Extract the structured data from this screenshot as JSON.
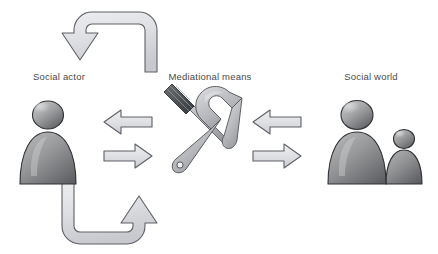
{
  "figure": {
    "background_color": "#ffffff",
    "width": 438,
    "height": 254
  },
  "palette": {
    "arrow_fill_light": "#e8e9ec",
    "arrow_fill_mid": "#d2d4d9",
    "arrow_stroke": "#5d6066",
    "figure_light": "#b9babc",
    "figure_mid": "#8f9193",
    "figure_dark": "#5f6164",
    "tool_light": "#c9cbcd",
    "tool_dark": "#4c4e51",
    "label_color": "#4a4a4a"
  },
  "nodes": [
    {
      "id": "social-actor",
      "label": "Social actor",
      "icon": "single-person-figure-icon",
      "position": "left"
    },
    {
      "id": "mediational-means",
      "label": "Mediational means",
      "icon": "crossed-wrench-screwdriver-icon",
      "position": "center"
    },
    {
      "id": "social-world",
      "label": "Social world",
      "icon": "two-person-figures-icon",
      "position": "right"
    }
  ],
  "connectors": [
    {
      "id": "arrow-center-to-actor",
      "icon": "left-arrow-icon",
      "direction": "left",
      "from": "mediational-means",
      "to": "social-actor"
    },
    {
      "id": "arrow-actor-to-center",
      "icon": "right-arrow-icon",
      "direction": "right",
      "from": "social-actor",
      "to": "mediational-means"
    },
    {
      "id": "arrow-world-to-center",
      "icon": "left-arrow-icon",
      "direction": "left",
      "from": "social-world",
      "to": "mediational-means"
    },
    {
      "id": "arrow-center-to-world",
      "icon": "right-arrow-icon",
      "direction": "right",
      "from": "mediational-means",
      "to": "social-world"
    },
    {
      "id": "arrow-top-curved-to-actor",
      "icon": "curved-arrow-down-left-icon",
      "direction": "down-left",
      "from": "mediational-means",
      "to": "social-actor"
    },
    {
      "id": "arrow-bottom-curved-to-center",
      "icon": "curved-arrow-up-right-icon",
      "direction": "up-right",
      "from": "social-actor",
      "to": "mediational-means"
    }
  ]
}
